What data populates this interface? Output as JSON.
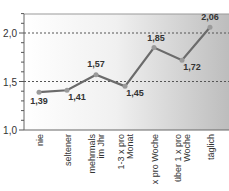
{
  "chart_data": {
    "type": "line",
    "title": "",
    "xlabel": "",
    "ylabel": "",
    "categories": [
      "nie",
      "seltener",
      "mehrmals im Jhr",
      "1-3 x pro Monat",
      "x pro Woche",
      "über 1 x pro Woche",
      "täglich"
    ],
    "category_lines": [
      [
        "nie"
      ],
      [
        "seltener"
      ],
      [
        "mehrmals",
        "im Jhr"
      ],
      [
        "1-3 x pro",
        "Monat"
      ],
      [
        "x pro Woche"
      ],
      [
        "über 1 x pro",
        "Woche"
      ],
      [
        "täglich"
      ]
    ],
    "series": [
      {
        "name": "",
        "values": [
          1.39,
          1.41,
          1.57,
          1.45,
          1.85,
          1.72,
          2.06
        ]
      }
    ],
    "value_labels": [
      "1,39",
      "1,41",
      "1,57",
      "1,45",
      "1,85",
      "1,72",
      "2,06"
    ],
    "ylim": [
      1.0,
      2.2
    ],
    "yticks": [
      1.0,
      1.5,
      2.0
    ],
    "ytick_labels": [
      "1,0",
      "1,5",
      "2,0"
    ],
    "grid": "dotted at 1,5 and 2,0",
    "legend": "none",
    "colors": {
      "line": "#6b6b6b",
      "marker": "#9a9a9a",
      "grid": "#555555",
      "bg_left": "#ffffff",
      "bg_right": "#bdbdbd"
    }
  }
}
